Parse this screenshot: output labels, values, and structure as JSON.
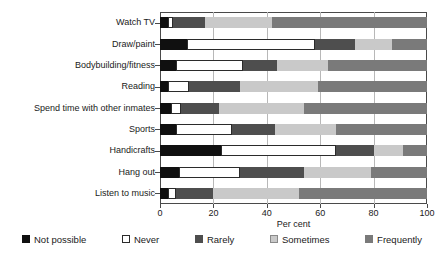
{
  "chart_data": {
    "type": "bar",
    "orientation": "horizontal",
    "stacked": true,
    "normalized": true,
    "title": "",
    "xlabel": "Per cent",
    "ylabel": "",
    "xlim": [
      0,
      100
    ],
    "xticks": [
      0,
      20,
      40,
      60,
      80,
      100
    ],
    "grid": true,
    "legend_position": "bottom",
    "categories": [
      "Watch TV",
      "Draw/paint",
      "Bodybuilding/fitness",
      "Reading",
      "Spend time with other inmates",
      "Sports",
      "Handicrafts",
      "Hang out",
      "Listen to music"
    ],
    "series": [
      {
        "name": "Not possible",
        "color": "#101010",
        "values": [
          3,
          10,
          6,
          3,
          4,
          6,
          23,
          7,
          3
        ]
      },
      {
        "name": "Never",
        "color": "#ffffff",
        "values": [
          2,
          48,
          25,
          8,
          4,
          21,
          43,
          23,
          3
        ]
      },
      {
        "name": "Rarely",
        "color": "#4e4e4e",
        "values": [
          12,
          15,
          13,
          19,
          14,
          16,
          14,
          24,
          14
        ]
      },
      {
        "name": "Sometimes",
        "color": "#c9c9c9",
        "values": [
          25,
          14,
          19,
          29,
          32,
          23,
          11,
          25,
          32
        ]
      },
      {
        "name": "Frequently",
        "color": "#7a7a7a",
        "values": [
          58,
          13,
          37,
          41,
          46,
          34,
          9,
          21,
          48
        ]
      }
    ]
  },
  "axis": {
    "x_title": "Per cent",
    "tick_labels": [
      "0",
      "20",
      "40",
      "60",
      "80",
      "100"
    ]
  },
  "legend": {
    "items": [
      {
        "label": "Not possible",
        "swatch": "legend-swatch-not-possible"
      },
      {
        "label": "Never",
        "swatch": "legend-swatch-never"
      },
      {
        "label": "Rarely",
        "swatch": "legend-swatch-rarely"
      },
      {
        "label": "Sometimes",
        "swatch": "legend-swatch-sometimes"
      },
      {
        "label": "Frequently",
        "swatch": "legend-swatch-frequently"
      }
    ]
  }
}
